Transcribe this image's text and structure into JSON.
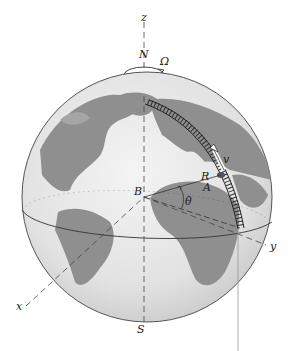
{
  "diagram": {
    "type": "rotating-earth-with-meridian-track",
    "labels": {
      "z_axis": "z",
      "x_axis": "x",
      "y_axis": "y",
      "north": "N",
      "south": "S",
      "angular_velocity": "Ω",
      "center": "B",
      "point": "A",
      "radius": "R",
      "latitude_angle": "θ",
      "velocity": "v"
    },
    "colors": {
      "ocean": "#e6e6e6",
      "land": "#8c8c8c",
      "outline": "#555555",
      "axis": "#444444",
      "track": "#222222"
    }
  }
}
